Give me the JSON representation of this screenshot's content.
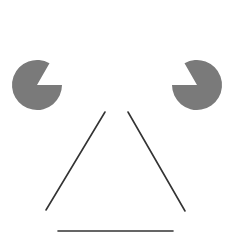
{
  "figure": {
    "type": "kanizsa-illusory-triangle",
    "background": "#ffffff",
    "fill_color": "#7a7a7a",
    "line_color": "#333333",
    "pacmen": [
      {
        "name": "left",
        "cx": 37,
        "cy": 85,
        "r": 25,
        "mouth_start_deg": -60,
        "mouth_end_deg": 0
      },
      {
        "name": "right",
        "cx": 197,
        "cy": 85,
        "r": 25,
        "mouth_start_deg": 180,
        "mouth_end_deg": 240
      }
    ],
    "lines": [
      {
        "name": "left-side",
        "x1": 105,
        "y1": 112,
        "x2": 46,
        "y2": 210
      },
      {
        "name": "right-side",
        "x1": 128,
        "y1": 112,
        "x2": 185,
        "y2": 211
      },
      {
        "name": "bottom",
        "x1": 58,
        "y1": 231,
        "x2": 173,
        "y2": 231
      }
    ]
  }
}
